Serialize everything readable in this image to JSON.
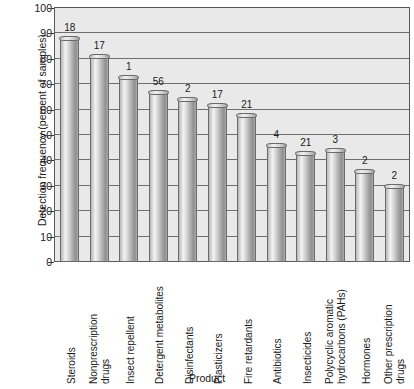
{
  "chart_data": {
    "type": "bar",
    "title": "",
    "xlabel": "Product",
    "ylabel": "Detection frequency (percent of samples)",
    "ylim": [
      0,
      100
    ],
    "ytick_values": [
      0,
      10,
      20,
      30,
      40,
      50,
      60,
      70,
      80,
      90,
      100
    ],
    "grid": true,
    "legend": "none",
    "categories": [
      "Steroids",
      "Nonprescription drugs",
      "Insect repellent",
      "Detergent metabolites",
      "Disinfectants",
      "Plasticizers",
      "Fire retardants",
      "Antibiotics",
      "Insecticides",
      "Polycyclic aromatic hydrocarbons (PAHs)",
      "Hormones",
      "Other prescription drugs"
    ],
    "category_lines": [
      [
        "Steroids"
      ],
      [
        "Nonprescription",
        "drugs"
      ],
      [
        "Insect repellent"
      ],
      [
        "Detergent metabolites"
      ],
      [
        "Disinfectants"
      ],
      [
        "Plasticizers"
      ],
      [
        "Fire retardants"
      ],
      [
        "Antibiotics"
      ],
      [
        "Insecticides"
      ],
      [
        "Polycyclic aromatic",
        "hydrocarbons (PAHs)"
      ],
      [
        "Hormones"
      ],
      [
        "Other prescription",
        "drugs"
      ]
    ],
    "values": [
      88,
      81,
      73,
      67,
      64,
      62,
      58,
      46,
      43,
      44,
      36,
      30
    ],
    "bar_annotations": [
      "18",
      "17",
      "1",
      "56",
      "2",
      "17",
      "21",
      "4",
      "21",
      "3",
      "2",
      "2"
    ]
  },
  "axis": {
    "y_title": "Detection frequency (percent of samples)",
    "x_title": "Product",
    "y_ticks": [
      "100",
      "90",
      "80",
      "70",
      "60",
      "50",
      "40",
      "30",
      "20",
      "10",
      "0"
    ]
  },
  "colors": {
    "plot_background": "#e9e9e9",
    "frame": "#585858",
    "gridline": "#6f6f6f",
    "bar_light": "#f3f3f3",
    "bar_dark": "#8e8e8e",
    "bar_outline": "#6a6a6a",
    "text": "#1a1a1a"
  }
}
